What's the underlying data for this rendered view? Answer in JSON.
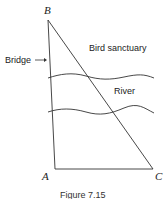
{
  "figure": {
    "caption": "Figure 7.15",
    "points": {
      "A": "A",
      "B": "B",
      "C": "C"
    },
    "labels": {
      "bridge": "Bridge",
      "sanctuary": "Bird sanctuary",
      "river": "River"
    },
    "colors": {
      "line": "#333333",
      "text": "#222222"
    }
  }
}
